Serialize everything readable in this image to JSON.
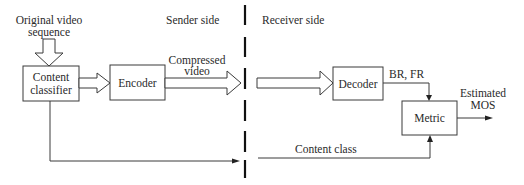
{
  "diagram": {
    "type": "block-diagram",
    "regions": {
      "sender_label": "Sender side",
      "receiver_label": "Receiver side"
    },
    "inputs": {
      "source_line1": "Original video",
      "source_line2": "sequence"
    },
    "blocks": {
      "classifier_line1": "Content",
      "classifier_line2": "classifier",
      "encoder": "Encoder",
      "decoder": "Decoder",
      "metric": "Metric"
    },
    "edges": {
      "compressed_line1": "Compressed",
      "compressed_line2": "video",
      "br_fr": "BR, FR",
      "content_class": "Content class",
      "output_line1": "Estimated",
      "output_line2": "MOS"
    },
    "colors": {
      "stroke": "#3a3a3a",
      "divider": "#111111",
      "background": "#ffffff"
    }
  }
}
